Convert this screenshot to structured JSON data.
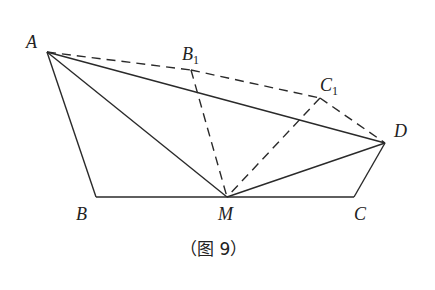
{
  "figure": {
    "caption": "（图 9）",
    "points": [
      {
        "id": "A",
        "label": "A",
        "sub": ""
      },
      {
        "id": "B1",
        "label": "B",
        "sub": "1"
      },
      {
        "id": "C1",
        "label": "C",
        "sub": "1"
      },
      {
        "id": "D",
        "label": "D",
        "sub": ""
      },
      {
        "id": "B",
        "label": "B",
        "sub": ""
      },
      {
        "id": "M",
        "label": "M",
        "sub": ""
      },
      {
        "id": "C",
        "label": "C",
        "sub": ""
      }
    ],
    "solid_segments": [
      [
        "A",
        "B"
      ],
      [
        "B",
        "C"
      ],
      [
        "C",
        "D"
      ],
      [
        "A",
        "M"
      ],
      [
        "A",
        "D"
      ],
      [
        "M",
        "D"
      ]
    ],
    "dashed_segments": [
      [
        "A",
        "B1"
      ],
      [
        "B1",
        "C1"
      ],
      [
        "C1",
        "D"
      ],
      [
        "B1",
        "M"
      ],
      [
        "C1",
        "M"
      ]
    ]
  }
}
